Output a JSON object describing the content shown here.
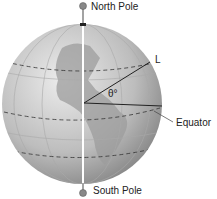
{
  "diagram": {
    "labels": {
      "north_pole": "North Pole",
      "south_pole": "South Pole",
      "equator": "Equator",
      "line": "L",
      "angle": "θ°"
    },
    "colors": {
      "globe_light": "#e4e4e4",
      "globe_dark": "#8a8a8a",
      "land": "#9a9a9a",
      "axis": "#ffffff",
      "line": "#222222"
    }
  }
}
